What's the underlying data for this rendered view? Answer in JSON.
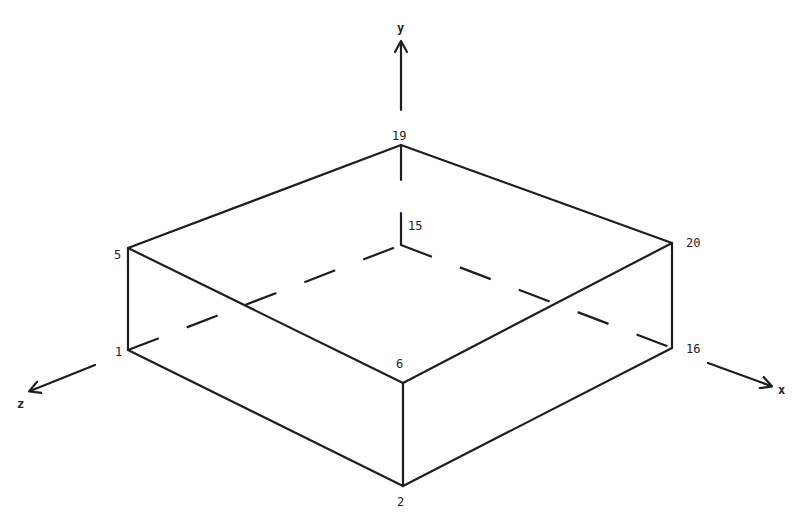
{
  "diagram": {
    "type": "isometric-box-with-node-numbers",
    "axes": {
      "x": {
        "label": "x"
      },
      "y": {
        "label": "y"
      },
      "z": {
        "label": "z"
      }
    },
    "nodes": [
      {
        "id": "1",
        "label": "1"
      },
      {
        "id": "2",
        "label": "2"
      },
      {
        "id": "5",
        "label": "5"
      },
      {
        "id": "6",
        "label": "6"
      },
      {
        "id": "15",
        "label": "15"
      },
      {
        "id": "16",
        "label": "16"
      },
      {
        "id": "19",
        "label": "19"
      },
      {
        "id": "20",
        "label": "20"
      }
    ],
    "visible_edges": [
      [
        "5",
        "19"
      ],
      [
        "19",
        "20"
      ],
      [
        "20",
        "6"
      ],
      [
        "6",
        "5"
      ],
      [
        "5",
        "1"
      ],
      [
        "1",
        "2"
      ],
      [
        "2",
        "6"
      ],
      [
        "2",
        "16"
      ],
      [
        "16",
        "20"
      ]
    ],
    "hidden_edges": [
      [
        "1",
        "15"
      ],
      [
        "15",
        "16"
      ],
      [
        "19",
        "15"
      ]
    ],
    "line_color": "#1e1e1e",
    "background": "#ffffff"
  }
}
